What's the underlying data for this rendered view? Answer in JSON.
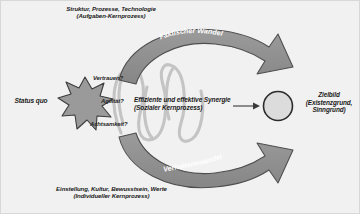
{
  "diagram": {
    "captions": {
      "top": "Struktur, Prozesse, Technologie (Aufgaben-Kernprozess)",
      "top_line1": "Struktur, Prozesse, Technologie",
      "top_line2": "(Aufgaben-Kernprozess)",
      "bottom_line1": "Einstellung, Kultur, Bewusstsein, Werte",
      "bottom_line2": "(Individueller Kernprozess)"
    },
    "left_anchor": {
      "label": "Status quo",
      "shape": "starburst-8-point"
    },
    "right_anchor": {
      "line1": "Zielbild",
      "line2": "(Existenzgrund,",
      "line3": "Sinngrund)",
      "shape": "circle"
    },
    "center": {
      "line1": "Effiziente und effektive Synergie",
      "line2": "(Sozialer Kernprozess)",
      "shape": "coil-spiral"
    },
    "questions": [
      {
        "label": "Vertrauen?"
      },
      {
        "label": "Agilität?"
      },
      {
        "label": "Achtsamkeit?"
      }
    ],
    "arrows": [
      {
        "label": "Faktischer Wandel",
        "position": "top",
        "direction": "left-to-right"
      },
      {
        "label": "Verhaltenswandel",
        "position": "bottom",
        "direction": "left-to-right"
      }
    ],
    "colors": {
      "background": "#f1f1f1",
      "arrow_fill": "#8d8d8d",
      "arrow_stroke": "#4a4a4a",
      "arrow_text": "#ffffff",
      "star_fill": "#9a9a9a",
      "star_stroke": "#3d3d3d",
      "circle_fill": "#dcdcdc",
      "circle_stroke": "#2b2b2b",
      "spiral_stroke": "#c4c4c4",
      "text": "#1b1b1b"
    }
  }
}
